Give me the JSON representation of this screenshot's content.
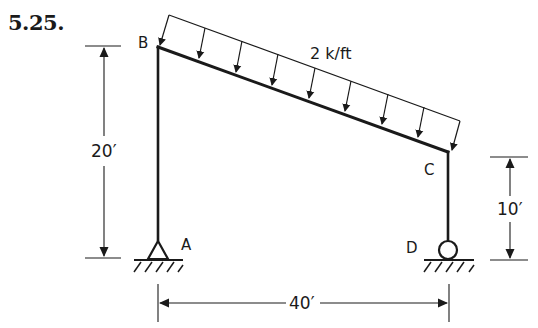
{
  "problem_number": "5.25.",
  "nodes": {
    "A": {
      "label": "A",
      "support": "pin"
    },
    "B": {
      "label": "B"
    },
    "C": {
      "label": "C"
    },
    "D": {
      "label": "D",
      "support": "roller"
    }
  },
  "load": {
    "label": "2 k/ft",
    "type": "uniform distributed, vertical, on member BC"
  },
  "dimensions": {
    "left_height": "20′",
    "right_height": "10′",
    "span": "40′"
  },
  "colors": {
    "ink": "#1a1a1a",
    "background": "#ffffff"
  }
}
